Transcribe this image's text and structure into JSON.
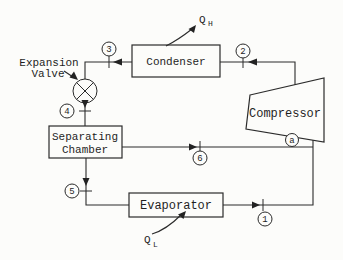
{
  "colors": {
    "ink": "#2b2b2b",
    "background": "#fcfcfa"
  },
  "diagram": {
    "condenser": {
      "label": "Condenser"
    },
    "compressor": {
      "label": "Compressor"
    },
    "evaporator": {
      "label": "Evaporator"
    },
    "separating_chamber": {
      "line1": "Separating",
      "line2": "Chamber"
    },
    "expansion_valve": {
      "line1": "Expansion",
      "line2": "Valve"
    },
    "heat_out": {
      "symbol": "Q",
      "subscript": "H"
    },
    "heat_in": {
      "symbol": "Q",
      "subscript": "L"
    },
    "state_points": {
      "s1": "1",
      "s2": "2",
      "s3": "3",
      "s4": "4",
      "s5": "5",
      "s6": "6",
      "sa": "a"
    }
  }
}
